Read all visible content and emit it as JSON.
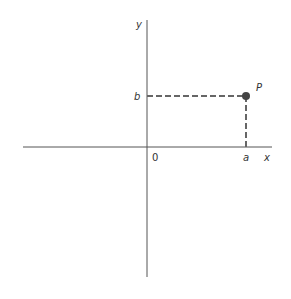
{
  "diagram": {
    "type": "cartesian-point",
    "axes": {
      "x_label": "x",
      "y_label": "y",
      "origin_label": "0"
    },
    "point": {
      "name": "P",
      "x_coord_label": "a",
      "y_coord_label": "b"
    },
    "colors": {
      "axis": "#555555",
      "dash": "#666666",
      "point": "#444444",
      "text": "#333333"
    }
  }
}
